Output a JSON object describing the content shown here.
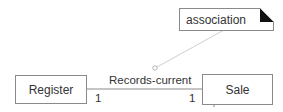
{
  "diagram": {
    "type": "UML class diagram fragment",
    "classes": [
      {
        "name": "Register"
      },
      {
        "name": "Sale"
      }
    ],
    "association": {
      "name": "Records-current",
      "multiplicity_left": "1",
      "multiplicity_right": "1"
    },
    "note": {
      "text": "association"
    },
    "colors": {
      "line": "#8a8a8a",
      "note_connector": "#c8c8c8",
      "fold": "#111111"
    }
  }
}
